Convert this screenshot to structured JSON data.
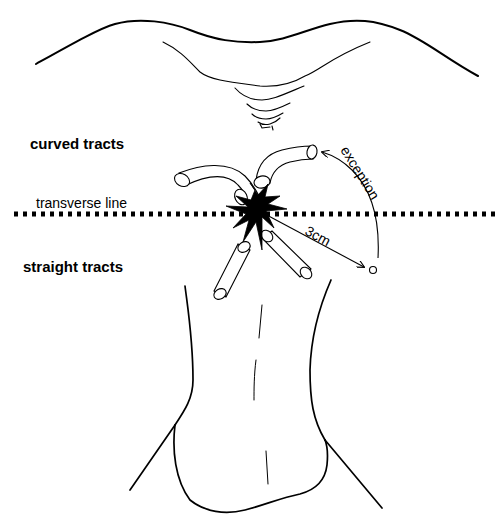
{
  "labels": {
    "curved_tracts": "curved tracts",
    "transverse_line": "transverse line",
    "straight_tracts": "straight tracts",
    "distance": "3cm",
    "exception": "exception"
  },
  "colors": {
    "line": "#000000",
    "background": "#ffffff"
  }
}
